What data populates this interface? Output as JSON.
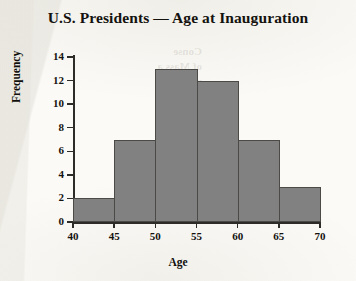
{
  "chart_data": {
    "type": "bar",
    "title": "U.S. Presidents — Age at Inauguration",
    "xlabel": "Age",
    "ylabel": "Frequency",
    "categories": [
      "40-45",
      "45-50",
      "50-55",
      "55-60",
      "60-65",
      "65-70"
    ],
    "bin_edges": [
      40,
      45,
      50,
      55,
      60,
      65,
      70
    ],
    "values": [
      2,
      7,
      13,
      12,
      7,
      3
    ],
    "xlim": [
      40,
      70
    ],
    "ylim": [
      0,
      14
    ],
    "xticks": [
      40,
      45,
      50,
      55,
      60,
      65,
      70
    ],
    "yticks": [
      0,
      2,
      4,
      6,
      8,
      10,
      12,
      14
    ],
    "grid": false,
    "legend": false,
    "bar_color": "#818181",
    "bar_edge_color": "#4c4a47",
    "axis_color": "#2e2c28",
    "text_color": "#14120f",
    "background": "#fbfaf7"
  },
  "ghost": {
    "showthrough": "Conse\nof Mass a\nparticul\nthe cou\nall"
  }
}
